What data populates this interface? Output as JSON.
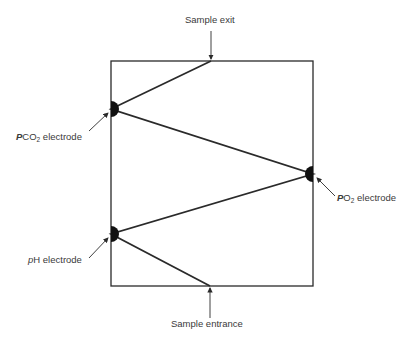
{
  "diagram": {
    "type": "blood gas analyzer measurement chamber schematic",
    "labels": {
      "sample_exit": "Sample exit",
      "sample_entrance": "Sample entrance",
      "pco2": {
        "prefix": "P",
        "mid": "CO",
        "sub": "2",
        "suffix": " electrode"
      },
      "po2": {
        "prefix": "P",
        "mid": "O",
        "sub": "2",
        "suffix": " electrode"
      },
      "ph": {
        "prefix": "p",
        "mid": "H",
        "suffix": " electrode"
      }
    },
    "colors": {
      "line": "#2a2a2a",
      "electrode": "#111111",
      "text": "#3a3a3a",
      "background": "#ffffff"
    },
    "flow_path": [
      "Sample entrance",
      "pH electrode",
      "PO2 electrode",
      "PCO2 electrode",
      "Sample exit"
    ]
  }
}
